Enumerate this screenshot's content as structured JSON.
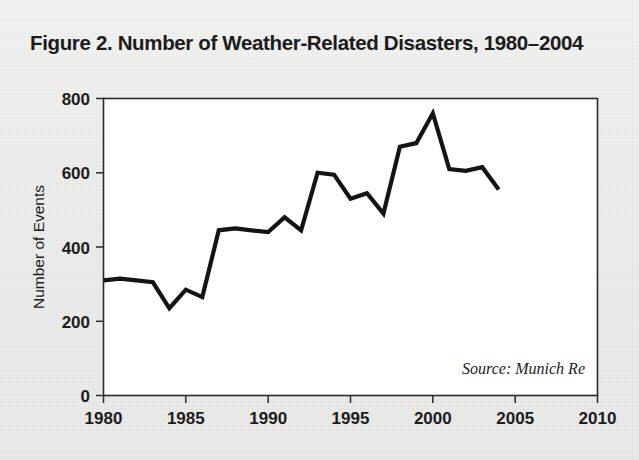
{
  "figure": {
    "title": "Figure 2. Number of Weather-Related Disasters, 1980–2004",
    "source_note": "Source: Munich Re",
    "background_color": "#eeeeec",
    "plot_background_color": "#ffffff",
    "line_color": "#141414",
    "text_color": "#1c1c1c"
  },
  "chart_data": {
    "type": "line",
    "title": "Figure 2. Number of Weather-Related Disasters, 1980–2004",
    "xlabel": "",
    "ylabel": "Number of Events",
    "xlim": [
      1980,
      2010
    ],
    "ylim": [
      0,
      800
    ],
    "xticks": [
      1980,
      1985,
      1990,
      1995,
      2000,
      2005,
      2010
    ],
    "xticklabels": [
      "1980",
      "1985",
      "1990",
      "1995",
      "2000",
      "2005",
      "2010"
    ],
    "yticks": [
      0,
      200,
      400,
      600,
      800
    ],
    "yticklabels": [
      "0",
      "200",
      "400",
      "600",
      "800"
    ],
    "grid": false,
    "legend": false,
    "annotations": [
      {
        "text": "Source: Munich Re",
        "x": 2001.5,
        "y": 75,
        "style": "italic",
        "align": "right"
      }
    ],
    "x": [
      1980,
      1981,
      1982,
      1983,
      1984,
      1985,
      1986,
      1987,
      1988,
      1989,
      1990,
      1991,
      1992,
      1993,
      1994,
      1995,
      1996,
      1997,
      1998,
      1999,
      2000,
      2001,
      2002,
      2003,
      2004
    ],
    "values": [
      310,
      315,
      310,
      305,
      235,
      285,
      265,
      445,
      450,
      445,
      440,
      480,
      445,
      600,
      595,
      530,
      545,
      490,
      670,
      680,
      760,
      610,
      605,
      615,
      555
    ],
    "series": [
      {
        "name": "Number of Events",
        "values": [
          310,
          315,
          310,
          305,
          235,
          285,
          265,
          445,
          450,
          445,
          440,
          480,
          445,
          600,
          595,
          530,
          545,
          490,
          670,
          680,
          760,
          610,
          605,
          615,
          555
        ]
      }
    ]
  }
}
